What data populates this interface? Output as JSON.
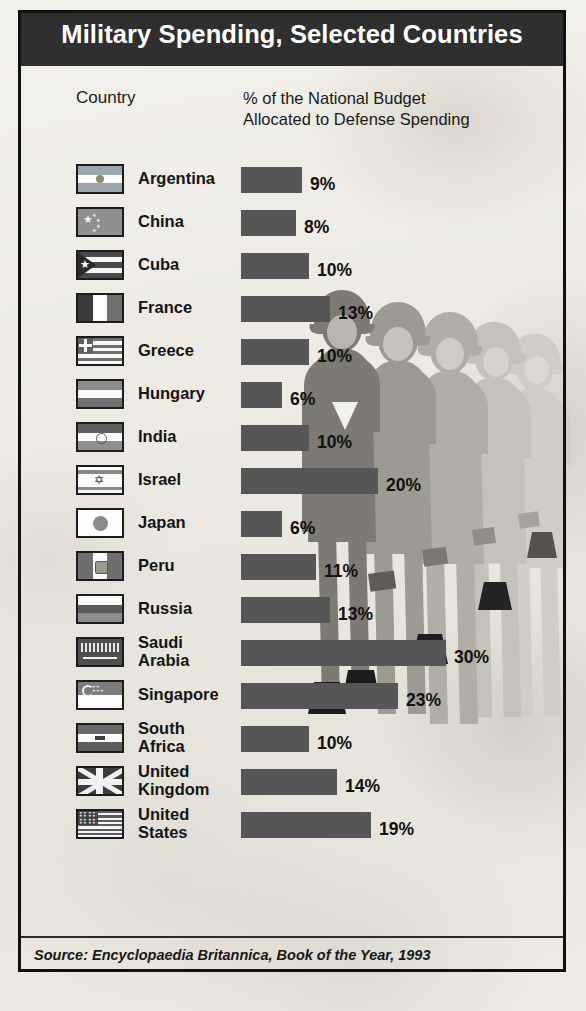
{
  "poster": {
    "title": "Military Spending, Selected Countries",
    "header_country": "Country",
    "header_metric_line1": "% of the National Budget",
    "header_metric_line2": "Allocated to Defense Spending",
    "source": "Source: Encyclopaedia Britannica, Book of the Year, 1993",
    "colors": {
      "title_band": "#2f2f2f",
      "title_text": "#ffffff",
      "bar": "#565656",
      "paper": "#ecebe4",
      "frame": "#111111",
      "soldier_front": "#6f6f6f",
      "soldier_back": "#c2c0b8",
      "boot": "#1d1d1d"
    }
  },
  "chart_data": {
    "type": "bar",
    "title": "Military Spending, Selected Countries",
    "xlabel": "% of the National Budget Allocated to Defense Spending",
    "ylabel": "Country",
    "xlim": [
      0,
      30
    ],
    "grid": false,
    "legend": "none",
    "orientation": "horizontal",
    "unit": "%",
    "source": "Source: Encyclopaedia Britannica, Book of the Year, 1993",
    "categories": [
      "Argentina",
      "China",
      "Cuba",
      "France",
      "Greece",
      "Hungary",
      "India",
      "Israel",
      "Japan",
      "Peru",
      "Russia",
      "Saudi Arabia",
      "Singapore",
      "South Africa",
      "United Kingdom",
      "United States"
    ],
    "values": [
      9,
      8,
      10,
      13,
      10,
      6,
      10,
      20,
      6,
      11,
      13,
      30,
      23,
      10,
      14,
      19
    ],
    "labels": [
      "9%",
      "8%",
      "10%",
      "13%",
      "10%",
      "6%",
      "10%",
      "20%",
      "6%",
      "11%",
      "13%",
      "30%",
      "23%",
      "10%",
      "14%",
      "19%"
    ]
  },
  "rows": [
    {
      "name": "Argentina",
      "name_l1": "Argentina",
      "name_l2": "",
      "value": 9,
      "label": "9%",
      "flag": "flag-argentina",
      "top": 160,
      "two_line": false
    },
    {
      "name": "China",
      "name_l1": "China",
      "name_l2": "",
      "value": 8,
      "label": "8%",
      "flag": "flag-china",
      "top": 203,
      "two_line": false
    },
    {
      "name": "Cuba",
      "name_l1": "Cuba",
      "name_l2": "",
      "value": 10,
      "label": "10%",
      "flag": "flag-cuba",
      "top": 246,
      "two_line": false
    },
    {
      "name": "France",
      "name_l1": "France",
      "name_l2": "",
      "value": 13,
      "label": "13%",
      "flag": "flag-france",
      "top": 289,
      "two_line": false
    },
    {
      "name": "Greece",
      "name_l1": "Greece",
      "name_l2": "",
      "value": 10,
      "label": "10%",
      "flag": "flag-greece",
      "top": 332,
      "two_line": false
    },
    {
      "name": "Hungary",
      "name_l1": "Hungary",
      "name_l2": "",
      "value": 6,
      "label": "6%",
      "flag": "flag-hungary",
      "top": 375,
      "two_line": false
    },
    {
      "name": "India",
      "name_l1": "India",
      "name_l2": "",
      "value": 10,
      "label": "10%",
      "flag": "flag-india",
      "top": 418,
      "two_line": false
    },
    {
      "name": "Israel",
      "name_l1": "Israel",
      "name_l2": "",
      "value": 20,
      "label": "20%",
      "flag": "flag-israel",
      "top": 461,
      "two_line": false
    },
    {
      "name": "Japan",
      "name_l1": "Japan",
      "name_l2": "",
      "value": 6,
      "label": "6%",
      "flag": "flag-japan",
      "top": 504,
      "two_line": false
    },
    {
      "name": "Peru",
      "name_l1": "Peru",
      "name_l2": "",
      "value": 11,
      "label": "11%",
      "flag": "flag-peru",
      "top": 547,
      "two_line": false
    },
    {
      "name": "Russia",
      "name_l1": "Russia",
      "name_l2": "",
      "value": 13,
      "label": "13%",
      "flag": "flag-russia",
      "top": 590,
      "two_line": false
    },
    {
      "name": "Saudi Arabia",
      "name_l1": "Saudi",
      "name_l2": "Arabia",
      "value": 30,
      "label": "30%",
      "flag": "flag-saudi-arabia",
      "top": 633,
      "two_line": true
    },
    {
      "name": "Singapore",
      "name_l1": "Singapore",
      "name_l2": "",
      "value": 23,
      "label": "23%",
      "flag": "flag-singapore",
      "top": 676,
      "two_line": false
    },
    {
      "name": "South Africa",
      "name_l1": "South",
      "name_l2": "Africa",
      "value": 10,
      "label": "10%",
      "flag": "flag-south-africa",
      "top": 719,
      "two_line": true
    },
    {
      "name": "United Kingdom",
      "name_l1": "United",
      "name_l2": "Kingdom",
      "value": 14,
      "label": "14%",
      "flag": "flag-united-kingdom",
      "top": 762,
      "two_line": true
    },
    {
      "name": "United States",
      "name_l1": "United",
      "name_l2": "States",
      "value": 19,
      "label": "19%",
      "flag": "flag-united-states",
      "top": 805,
      "two_line": true
    }
  ]
}
